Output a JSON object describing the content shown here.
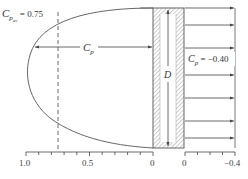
{
  "diagram": {
    "cp_avg_label": "C",
    "cp_avg_sub": "p",
    "cp_avg_subsub": "av",
    "cp_avg_value": " = 0.75",
    "cp_label": "C",
    "cp_sub": "p",
    "dimension_label": "D",
    "right_cp_label": "C",
    "right_cp_sub": "p",
    "right_cp_value": " = −0.40",
    "colors": {
      "line": "#444444",
      "hatch": "#999999",
      "text": "#333333"
    }
  },
  "left_axis": {
    "ticks": [
      "1.0",
      "0.5",
      "0"
    ]
  },
  "right_axis": {
    "ticks": [
      "0",
      "−0.4"
    ]
  }
}
